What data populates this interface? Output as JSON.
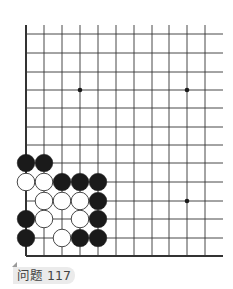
{
  "diagram": {
    "type": "go-board-problem",
    "grid": {
      "columns": 11,
      "rows": 13,
      "col_x": [
        26,
        44,
        62,
        80,
        98,
        116,
        134,
        152,
        169,
        187,
        205
      ],
      "row_y": [
        34,
        53,
        72,
        90,
        108,
        127,
        145,
        163,
        182,
        201,
        219,
        238,
        256
      ],
      "line_top": 25,
      "line_right": 223,
      "edges": [
        "left",
        "bottom"
      ],
      "line_color": "#333333"
    },
    "star_points": [
      {
        "col": 3,
        "row": 3
      },
      {
        "col": 9,
        "row": 3
      },
      {
        "col": 9,
        "row": 9
      }
    ],
    "stones": [
      {
        "color": "black",
        "col": 0,
        "row": 7
      },
      {
        "color": "black",
        "col": 1,
        "row": 7
      },
      {
        "color": "white",
        "col": 0,
        "row": 8
      },
      {
        "color": "white",
        "col": 1,
        "row": 8
      },
      {
        "color": "black",
        "col": 2,
        "row": 8
      },
      {
        "color": "black",
        "col": 3,
        "row": 8
      },
      {
        "color": "black",
        "col": 4,
        "row": 8
      },
      {
        "color": "white",
        "col": 1,
        "row": 9
      },
      {
        "color": "white",
        "col": 2,
        "row": 9
      },
      {
        "color": "white",
        "col": 3,
        "row": 9
      },
      {
        "color": "black",
        "col": 4,
        "row": 9
      },
      {
        "color": "black",
        "col": 0,
        "row": 10
      },
      {
        "color": "white",
        "col": 1,
        "row": 10
      },
      {
        "color": "white",
        "col": 3,
        "row": 10
      },
      {
        "color": "black",
        "col": 4,
        "row": 10
      },
      {
        "color": "black",
        "col": 0,
        "row": 11
      },
      {
        "color": "white",
        "col": 2,
        "row": 11
      },
      {
        "color": "black",
        "col": 3,
        "row": 11
      },
      {
        "color": "black",
        "col": 4,
        "row": 11
      }
    ],
    "colors": {
      "black_stone": "#1a1a1a",
      "white_stone": "#ffffff",
      "white_stone_border": "#333333"
    }
  },
  "label": {
    "text": "问题 117"
  }
}
